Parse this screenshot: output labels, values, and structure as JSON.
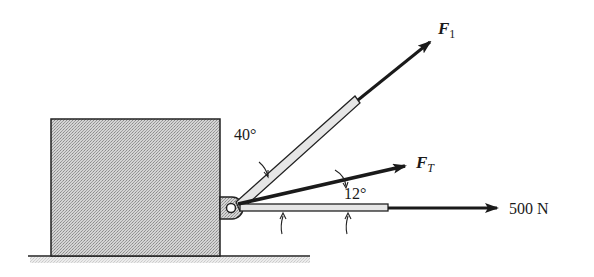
{
  "diagram": {
    "type": "statics force diagram",
    "block": {
      "fill": "#c8c8c8",
      "stroke": "#222222"
    },
    "ground": {
      "stroke": "#222222"
    },
    "forces": [
      {
        "id": "F1",
        "symbol": "F",
        "subscript": "1",
        "angle_label": "40°"
      },
      {
        "id": "FT",
        "symbol": "F",
        "subscript": "T",
        "angle_label": "12°"
      },
      {
        "id": "P",
        "value_label": "500 N"
      }
    ],
    "labels": {
      "f1_symbol": "F",
      "f1_sub": "1",
      "ft_symbol": "F",
      "ft_sub": "T",
      "force_500": "500 N",
      "angle_40": "40°",
      "angle_12": "12°"
    },
    "colors": {
      "ink": "#1a1a1a",
      "block": "#c8c8c8",
      "rod_fill": "#e6e6e6"
    }
  }
}
